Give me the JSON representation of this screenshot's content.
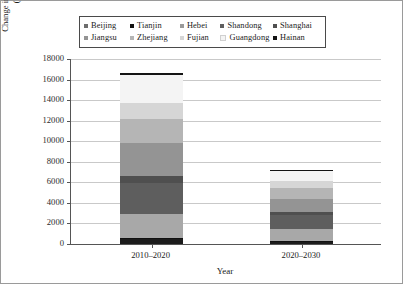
{
  "chart_data": {
    "type": "bar",
    "subtype": "stacked-vertical",
    "title": "",
    "xlabel": "Year",
    "ylabel": "Change in Electricity Consumption (100 million kWh)",
    "ylabel_line1": "Change in Electricity Consumption",
    "ylabel_line2": "(100 million kWh)",
    "categories": [
      "2010–2020",
      "2020–2030"
    ],
    "ylim": [
      0,
      18000
    ],
    "ytick_step": 2000,
    "yticks": [
      0,
      2000,
      4000,
      6000,
      8000,
      10000,
      12000,
      14000,
      16000,
      18000
    ],
    "ytick_labels": [
      "0",
      "2000",
      "4000",
      "6000",
      "8000",
      "10000",
      "12000",
      "14000",
      "16000",
      "18000"
    ],
    "grid": true,
    "grid_axis": "y",
    "legend_position": "top",
    "legend_columns": 5,
    "legend_rows": 2,
    "series": [
      {
        "name": "Beijing",
        "color": "#1c1c1c",
        "values": [
          520,
          230
        ]
      },
      {
        "name": "Tianjin",
        "color": "#111111",
        "values": [
          60,
          30
        ]
      },
      {
        "name": "Hebei",
        "color": "#a8a8a8",
        "values": [
          2340,
          1180
        ]
      },
      {
        "name": "Shandong",
        "color": "#5e5e5e",
        "values": [
          3000,
          1380
        ]
      },
      {
        "name": "Shanghai",
        "color": "#4f4f4f",
        "values": [
          680,
          300
        ]
      },
      {
        "name": "Jiangsu",
        "color": "#949494",
        "values": [
          3200,
          1300
        ]
      },
      {
        "name": "Zhejiang",
        "color": "#b5b5b5",
        "values": [
          2400,
          1000
        ]
      },
      {
        "name": "Fujian",
        "color": "#d6d6d6",
        "values": [
          1500,
          700
        ]
      },
      {
        "name": "Guangdong",
        "color": "#f4f4f4",
        "values": [
          2780,
          1030
        ]
      },
      {
        "name": "Hainan",
        "color": "#141414",
        "values": [
          180,
          90
        ]
      }
    ],
    "totals": [
      16660,
      7240
    ]
  },
  "legend": {
    "row1": [
      {
        "label": "Beijing",
        "color": "#6d6d6d"
      },
      {
        "label": "Tianjin",
        "color": "#111111"
      },
      {
        "label": "Hebei",
        "color": "#9a9a9a"
      },
      {
        "label": "Shandong",
        "color": "#5e5e5e"
      },
      {
        "label": "Shanghai",
        "color": "#4f4f4f"
      }
    ],
    "row2": [
      {
        "label": "Jiangsu",
        "color": "#949494"
      },
      {
        "label": "Zhejiang",
        "color": "#b5b5b5"
      },
      {
        "label": "Fujian",
        "color": "#d6d6d6"
      },
      {
        "label": "Guangdong",
        "color": "#f4f4f4"
      },
      {
        "label": "Hainan",
        "color": "#141414"
      }
    ]
  }
}
